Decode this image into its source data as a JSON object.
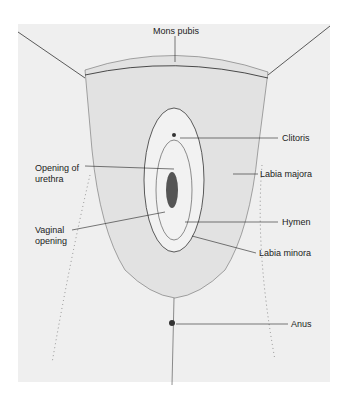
{
  "figure": {
    "background_color": "#efefef",
    "line_color": "#222222",
    "labels": [
      {
        "id": "mons-pubis",
        "text": "Mons pubis"
      },
      {
        "id": "clitoris",
        "text": "Clitoris"
      },
      {
        "id": "opening-of-urethra",
        "text": "Opening of urethra"
      },
      {
        "id": "labia-majora",
        "text": "Labia majora"
      },
      {
        "id": "hymen",
        "text": "Hymen"
      },
      {
        "id": "vaginal-opening",
        "text": "Vaginal opening"
      },
      {
        "id": "labia-minora",
        "text": "Labia minora"
      },
      {
        "id": "anus",
        "text": "Anus"
      }
    ]
  },
  "text": {
    "mons": "Mons pubis",
    "clitoris": "Clitoris",
    "urethra_1": "Opening of",
    "urethra_2": "urethra",
    "labia_majora": "Labia majora",
    "hymen": "Hymen",
    "vaginal_1": "Vaginal",
    "vaginal_2": "opening",
    "labia_minora": "Labia minora",
    "anus": "Anus"
  }
}
